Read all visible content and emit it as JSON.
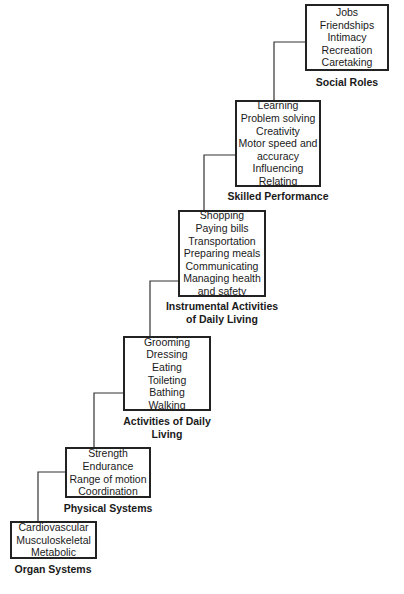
{
  "diagram": {
    "type": "staircase hierarchy",
    "levels": [
      {
        "id": "organ",
        "label": "Organ Systems",
        "items": [
          "Cardiovascular",
          "Musculoskeletal",
          "Metabolic"
        ]
      },
      {
        "id": "physical",
        "label": "Physical Systems",
        "items": [
          "Strength",
          "Endurance",
          "Range of motion",
          "Coordination"
        ]
      },
      {
        "id": "adl",
        "label_lines": [
          "Activities of Daily",
          "Living"
        ],
        "items": [
          "Grooming",
          "Dressing",
          "Eating",
          "Toileting",
          "Bathing",
          "Walking"
        ]
      },
      {
        "id": "iadl",
        "label_lines": [
          "Instrumental Activities",
          "of Daily Living"
        ],
        "items": [
          "Shopping",
          "Paying bills",
          "Transportation",
          "Preparing meals",
          "Communicating",
          "Managing health",
          "and safety"
        ]
      },
      {
        "id": "skilled",
        "label": "Skilled Performance",
        "items": [
          "Learning",
          "Problem solving",
          "Creativity",
          "Motor speed and",
          "accuracy",
          "Influencing",
          "Relating"
        ]
      },
      {
        "id": "social",
        "label": "Social Roles",
        "items": [
          "Jobs",
          "Friendships",
          "Intimacy",
          "Recreation",
          "Caretaking"
        ]
      }
    ]
  }
}
